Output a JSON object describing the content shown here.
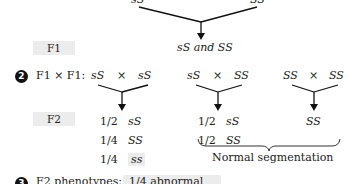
{
  "parents": {
    "left": "sS",
    "right": "SS"
  },
  "f1": {
    "label": "F1",
    "result": "sS and SS"
  },
  "step2": {
    "number": "2",
    "label": "F1 × F1:",
    "crosses": [
      {
        "left": "sS",
        "x": "×",
        "right": "sS"
      },
      {
        "left": "sS",
        "x": "×",
        "right": "SS"
      },
      {
        "left": "SS",
        "x": "×",
        "right": "SS"
      }
    ]
  },
  "f2": {
    "label": "F2",
    "col1": [
      {
        "frac": "1/2",
        "geno": "sS"
      },
      {
        "frac": "1/4",
        "geno": "SS"
      },
      {
        "frac": "1/4",
        "geno": "ss"
      }
    ],
    "col2": [
      {
        "frac": "1/2",
        "geno": "sS"
      },
      {
        "frac": "1/2",
        "geno": "SS"
      }
    ],
    "col3": "SS",
    "brace_label": "Normal segmentation"
  },
  "step3": {
    "number": "3",
    "label": "F2 phenotypes:",
    "highlight": "1/4 abnormal"
  }
}
